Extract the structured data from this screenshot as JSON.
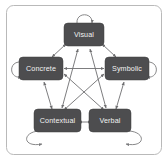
{
  "figure": {
    "background_color": "#ffffff",
    "frame_color": "#b9b9b9",
    "node_fill": "#4d4d4f",
    "node_text_color": "#f2f2f2",
    "edge_color": "#6e6e70"
  },
  "nodes": [
    {
      "id": "visual",
      "label": "Visual",
      "position": "top",
      "cx": 84,
      "cy": 35
    },
    {
      "id": "concrete",
      "label": "Concrete",
      "position": "left",
      "cx": 41,
      "cy": 69
    },
    {
      "id": "symbolic",
      "label": "Symbolic",
      "position": "right",
      "cx": 127,
      "cy": 69
    },
    {
      "id": "contextual",
      "label": "Contextual",
      "position": "bottom-left",
      "cx": 58,
      "cy": 121
    },
    {
      "id": "verbal",
      "label": "Verbal",
      "position": "bottom-right",
      "cx": 110,
      "cy": 121
    }
  ],
  "edges": [
    {
      "from": "concrete",
      "to": "visual",
      "style": "bidirectional",
      "shape": "straight"
    },
    {
      "from": "visual",
      "to": "symbolic",
      "style": "bidirectional",
      "shape": "straight"
    },
    {
      "from": "concrete",
      "to": "contextual",
      "style": "bidirectional",
      "shape": "straight"
    },
    {
      "from": "symbolic",
      "to": "verbal",
      "style": "bidirectional",
      "shape": "straight"
    },
    {
      "from": "contextual",
      "to": "verbal",
      "style": "bidirectional",
      "shape": "straight"
    },
    {
      "from": "concrete",
      "to": "symbolic",
      "style": "bidirectional",
      "shape": "straight"
    },
    {
      "from": "visual",
      "to": "contextual",
      "style": "bidirectional",
      "shape": "straight"
    },
    {
      "from": "visual",
      "to": "verbal",
      "style": "bidirectional",
      "shape": "straight"
    },
    {
      "from": "concrete",
      "to": "verbal",
      "style": "bidirectional",
      "shape": "straight"
    },
    {
      "from": "symbolic",
      "to": "contextual",
      "style": "bidirectional",
      "shape": "straight"
    }
  ],
  "self_loops": [
    {
      "node": "visual",
      "direction": "up"
    },
    {
      "node": "concrete",
      "direction": "left"
    },
    {
      "node": "symbolic",
      "direction": "right"
    },
    {
      "node": "contextual",
      "direction": "down-left"
    },
    {
      "node": "verbal",
      "direction": "down-right"
    }
  ]
}
